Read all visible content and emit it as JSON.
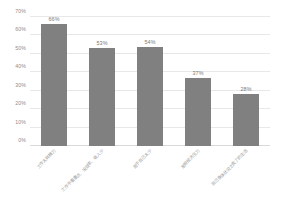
{
  "chart_data": {
    "type": "bar",
    "title": "",
    "subtitle": "",
    "xlabel": "",
    "ylabel": "",
    "categories": [
      "工作太耗精力",
      "工作不看重点、没效率、收入少",
      "用于自己太少",
      "家庭经济压力",
      "自己身体状况之类了的生活"
    ],
    "values": [
      66,
      53,
      54,
      37,
      28
    ],
    "value_labels": [
      "66%",
      "53%",
      "54%",
      "37%",
      "28%"
    ],
    "ytick_labels": [
      "0%",
      "10%",
      "20%",
      "30%",
      "40%",
      "50%",
      "60%",
      "70%"
    ],
    "ytick_values": [
      0,
      10,
      20,
      30,
      40,
      50,
      60,
      70
    ],
    "ylim": [
      0,
      70
    ],
    "grid": true,
    "legend": false,
    "legend_position": "none",
    "bar_color": "#808080",
    "gridline_color": "#e8e8e8",
    "axis_text_color": "#8c8c8c",
    "background_color": "#ffffff",
    "xtick_label_rotation": -45
  }
}
